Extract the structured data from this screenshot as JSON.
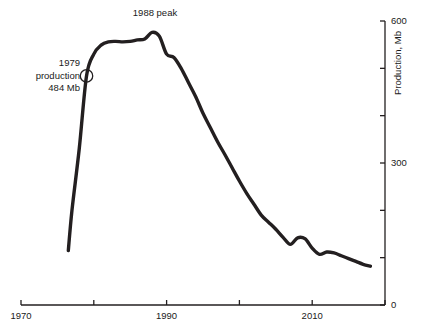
{
  "chart_data": {
    "type": "line",
    "title": "",
    "subtitle": "",
    "xlabel": "",
    "ylabel": "Production, Mb",
    "xlim": [
      1970,
      2020
    ],
    "ylim": [
      0,
      600
    ],
    "grid": false,
    "legend": "none",
    "x_ticks": [
      1970,
      1980,
      1990,
      2000,
      2010,
      2020
    ],
    "x_tick_labels": [
      "1970",
      "",
      "1990",
      "",
      "2010",
      ""
    ],
    "y_ticks": [
      0,
      100,
      200,
      300,
      400,
      500,
      600
    ],
    "y_tick_labels": [
      "0",
      "",
      "",
      "300",
      "",
      "",
      "600"
    ],
    "y_axis_position": "right",
    "line_color": "#231f20",
    "line_width": 3.4,
    "series": [
      {
        "name": "Production",
        "x": [
          1976.5,
          1977,
          1978,
          1979,
          1980,
          1981,
          1982,
          1983,
          1984,
          1985,
          1986,
          1987,
          1988,
          1989,
          1990,
          1991,
          1992,
          1993,
          1994,
          1995,
          1996,
          1997,
          1998,
          1999,
          2000,
          2001,
          2002,
          2003,
          2004,
          2005,
          2006,
          2007,
          2008,
          2009,
          2010,
          2011,
          2012,
          2013,
          2014,
          2015,
          2016,
          2017,
          2018
        ],
        "values": [
          115,
          200,
          330,
          484,
          530,
          549,
          556,
          557,
          556,
          557,
          560,
          562,
          576,
          568,
          530,
          523,
          500,
          470,
          440,
          405,
          375,
          345,
          318,
          290,
          262,
          236,
          213,
          190,
          175,
          160,
          143,
          128,
          142,
          140,
          120,
          107,
          112,
          110,
          104,
          98,
          92,
          86,
          82
        ]
      }
    ],
    "annotations": [
      {
        "name": "peak-label",
        "text": "1988 peak",
        "x": 1988,
        "y": 576
      },
      {
        "name": "production-1979-label",
        "line1": "1979",
        "line2": "production",
        "line3": "484 Mb",
        "x": 1979,
        "y": 484,
        "marker": "open-circle"
      }
    ]
  },
  "axes": {
    "y_title": "Production, Mb",
    "x_labels": [
      {
        "value": "1970",
        "x": 1970
      },
      {
        "value": "1990",
        "x": 1990
      },
      {
        "value": "2010",
        "x": 2010
      }
    ],
    "y_labels": [
      {
        "value": "600",
        "y": 600
      },
      {
        "value": "300",
        "y": 300
      },
      {
        "value": "0",
        "y": 0
      }
    ]
  },
  "annotations": {
    "peak": {
      "text": "1988 peak"
    },
    "production_1979": {
      "line1": "1979",
      "line2": "production",
      "line3": "484 Mb"
    }
  },
  "colors": {
    "line": "#231f20",
    "axis": "#231f20",
    "text": "#1a1a1a",
    "background": "#ffffff"
  }
}
